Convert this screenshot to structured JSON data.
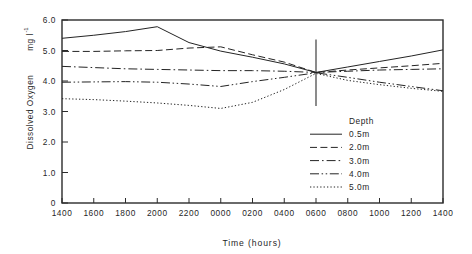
{
  "chart_data": {
    "type": "line",
    "title": "",
    "xlabel": "Time  (hours)",
    "ylabel": "Dissolved  Oxygen",
    "ylabel_units": "mg l",
    "ylabel_units_exponent": "-1",
    "xlim": [
      0,
      12
    ],
    "ylim": [
      0,
      6.0
    ],
    "grid": false,
    "legend_position": "inside-lower-right",
    "legend_title": "Depth",
    "x": [
      "1400",
      "1600",
      "1800",
      "2000",
      "2200",
      "0000",
      "0200",
      "0400",
      "0600",
      "0800",
      "1000",
      "1200",
      "1400"
    ],
    "xticklabels": [
      "1400",
      "1600",
      "1800",
      "2000",
      "2200",
      "0000",
      "0200",
      "0400",
      "0600",
      "0800",
      "1000",
      "1200",
      "1400"
    ],
    "yticklabels": [
      "0",
      "1.0",
      "2.0",
      "3.0",
      "4.0",
      "5.0",
      "6.0"
    ],
    "ytickvalues": [
      0,
      1.0,
      2.0,
      3.0,
      4.0,
      5.0,
      6.0
    ],
    "series": [
      {
        "name": "0.5m",
        "label": "0.5m",
        "style": "solid",
        "values": [
          5.4,
          5.5,
          5.62,
          5.78,
          5.26,
          4.98,
          4.78,
          4.56,
          4.28,
          4.46,
          4.64,
          4.82,
          5.02
        ]
      },
      {
        "name": "2.0m",
        "label": "2.0m",
        "style": "dashed",
        "values": [
          4.97,
          4.97,
          4.99,
          5.0,
          5.08,
          5.12,
          4.86,
          4.62,
          4.28,
          4.36,
          4.43,
          4.5,
          4.58
        ]
      },
      {
        "name": "3.0m",
        "label": "3.0m",
        "style": "dashdot",
        "values": [
          4.48,
          4.44,
          4.4,
          4.38,
          4.36,
          4.34,
          4.34,
          4.32,
          4.28,
          4.32,
          4.36,
          4.38,
          4.4
        ]
      },
      {
        "name": "4.0m",
        "label": "4.0m",
        "style": "dashdotdot",
        "values": [
          3.96,
          3.97,
          3.98,
          3.96,
          3.9,
          3.82,
          3.98,
          4.12,
          4.27,
          4.12,
          3.96,
          3.82,
          3.68
        ]
      },
      {
        "name": "5.0m",
        "label": "5.0m",
        "style": "dotted",
        "values": [
          3.42,
          3.39,
          3.34,
          3.28,
          3.2,
          3.1,
          3.3,
          3.72,
          4.25,
          4.02,
          3.88,
          3.76,
          3.66
        ]
      }
    ],
    "annotations": [
      {
        "name": "error-bar",
        "type": "vertical-bar",
        "x_index": 8,
        "center": 4.27,
        "low": 3.18,
        "high": 5.36
      }
    ]
  },
  "legend": {
    "title": "Depth",
    "entries": [
      {
        "label": "0.5m",
        "style": "solid"
      },
      {
        "label": "2.0m",
        "style": "dashed"
      },
      {
        "label": "3.0m",
        "style": "dashdot"
      },
      {
        "label": "4.0m",
        "style": "dashdotdot"
      },
      {
        "label": "5.0m",
        "style": "dotted"
      }
    ]
  },
  "colors": {
    "ink": "#242424",
    "frame": "#2b2b2b",
    "background": "#ffffff"
  }
}
